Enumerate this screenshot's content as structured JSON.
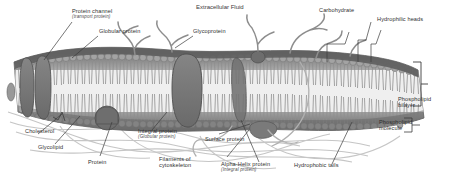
{
  "figure": {
    "kind": "cell-membrane-fluid-mosaic-diagram",
    "title": "Extracellular Fluid",
    "palette": {
      "background": "#ffffff",
      "label_text": "#2f2f2f",
      "leader_line": "#3a3a3a",
      "membrane_dark": "#5d5d5d",
      "membrane_mid": "#8a8a8a",
      "lipid_head": "#a9a9a9",
      "lipid_tail": "#9a9a9a",
      "protein_fill": "#6f6f6f",
      "cytoskeleton": "#bdbdbd",
      "carbohydrate_chain": "#8f8f8f"
    }
  },
  "labels": {
    "protein_channel": {
      "line1": "Protein channel",
      "line2": "(transport protein)"
    },
    "globular_protein": {
      "line1": "Globular protein"
    },
    "glycoprotein": {
      "line1": "Glycoprotein"
    },
    "carbohydrate": {
      "line1": "Carbohydrate"
    },
    "hydrophilic_heads": {
      "line1": "Hydrophilic heads"
    },
    "phospholipid_bilayer": {
      "line1": "Phospholipid",
      "line2": "bilayer"
    },
    "phospholipid_molecule": {
      "line1": "Phospholipid",
      "line2": "molecule"
    },
    "cholesterol": {
      "line1": "Cholesterol"
    },
    "glycolipid": {
      "line1": "Glycolipid"
    },
    "protein": {
      "line1": "Protein"
    },
    "integral_protein": {
      "line1": "Integral protein",
      "line2": "(Globular protein)"
    },
    "surface_protein": {
      "line1": "Surface protein"
    },
    "filaments_of_cytoskeleton": {
      "line1": "Filaments of",
      "line2": "cytoskeleton"
    },
    "alpha_helix_protein": {
      "line1": "Alpha-Helix protein",
      "line2": "(Integral protein)"
    },
    "hydrophobic_tails": {
      "line1": "Hydrophobic tails"
    }
  }
}
